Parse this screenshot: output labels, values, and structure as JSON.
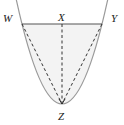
{
  "diagram": {
    "type": "parabola-geometry",
    "labels": {
      "w": "W",
      "x": "X",
      "y": "Y",
      "z": "Z"
    },
    "points": {
      "W": [
        22,
        24
      ],
      "X": [
        62,
        24
      ],
      "Y": [
        102,
        24
      ],
      "Z": [
        62,
        104
      ]
    },
    "colors": {
      "parabola": "#9a9a9a",
      "chord": "#555555",
      "dashed": "#333333",
      "fill": "#f3f3f3",
      "label": "#222222"
    }
  }
}
